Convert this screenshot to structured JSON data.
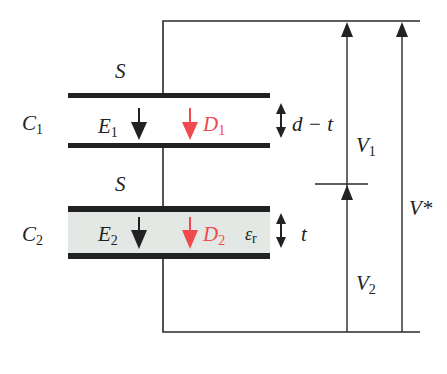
{
  "diagram": {
    "colors": {
      "line": "#2a2a2a",
      "plate": "#222222",
      "dielectric_fill": "#e3e8e5",
      "displacement": "#f04a4e"
    },
    "labels": {
      "area_top": "S",
      "area_bottom": "S",
      "c1": {
        "main": "C",
        "sub": "1"
      },
      "c2": {
        "main": "C",
        "sub": "2"
      },
      "e1": {
        "main": "E",
        "sub": "1"
      },
      "e2": {
        "main": "E",
        "sub": "2"
      },
      "d1": {
        "main": "D",
        "sub": "1"
      },
      "d2": {
        "main": "D",
        "sub": "2"
      },
      "eps": {
        "main": "ε",
        "sub": "r"
      },
      "gap1": "d − t",
      "gap2": "t",
      "v1": {
        "main": "V",
        "sub": "1"
      },
      "v2": {
        "main": "V",
        "sub": "2"
      },
      "vtotal": "V*"
    }
  }
}
